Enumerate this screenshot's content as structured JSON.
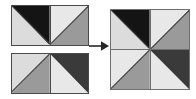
{
  "figure": {
    "background": "#ffffff",
    "outline_color": "#4a4a4a",
    "diagonal_color": "#3c3c3c"
  },
  "palette": {
    "black": "#141414",
    "dark_gray": "#3a3a3a",
    "medium_gray": "#9a9a9a",
    "light_gray": "#dcdcdc",
    "pale_gray": "#e8e8e8"
  },
  "operator": {
    "name": "right-arrow",
    "symbol": "→",
    "label": "yields"
  },
  "sources": [
    {
      "name": "top-source-rectangle",
      "label": "Top source pair",
      "squares": [
        {
          "name": "top-source-left-square",
          "diagonal": "tl-br",
          "upper_fill": "#141414",
          "lower_fill": "#dcdcdc",
          "upper_shade": "black",
          "lower_shade": "light_gray"
        },
        {
          "name": "top-source-right-square",
          "diagonal": "tr-bl",
          "upper_fill": "#e8e8e8",
          "lower_fill": "#9a9a9a",
          "upper_shade": "pale_gray",
          "lower_shade": "medium_gray"
        }
      ]
    },
    {
      "name": "bottom-source-rectangle",
      "label": "Bottom source pair",
      "squares": [
        {
          "name": "bottom-source-left-square",
          "diagonal": "tr-bl",
          "upper_fill": "#dcdcdc",
          "lower_fill": "#9a9a9a",
          "upper_shade": "light_gray",
          "lower_shade": "medium_gray"
        },
        {
          "name": "bottom-source-right-square",
          "diagonal": "tl-br",
          "upper_fill": "#3a3a3a",
          "lower_fill": "#e8e8e8",
          "upper_shade": "dark_gray",
          "lower_shade": "pale_gray"
        }
      ]
    }
  ],
  "result": {
    "name": "pinwheel-result-block",
    "label": "Resulting pinwheel block",
    "rows": 2,
    "columns": 2,
    "quadrants": [
      {
        "name": "result-top-left-quadrant",
        "position": "top-left",
        "diagonal": "tl-br",
        "upper_fill": "#141414",
        "lower_fill": "#dcdcdc",
        "upper_shade": "black",
        "lower_shade": "light_gray"
      },
      {
        "name": "result-top-right-quadrant",
        "position": "top-right",
        "diagonal": "tr-bl",
        "upper_fill": "#e8e8e8",
        "lower_fill": "#9a9a9a",
        "upper_shade": "pale_gray",
        "lower_shade": "medium_gray"
      },
      {
        "name": "result-bottom-left-quadrant",
        "position": "bottom-left",
        "diagonal": "tr-bl",
        "upper_fill": "#e8e8e8",
        "lower_fill": "#9a9a9a",
        "upper_shade": "pale_gray",
        "lower_shade": "medium_gray"
      },
      {
        "name": "result-bottom-right-quadrant",
        "position": "bottom-right",
        "diagonal": "tl-br",
        "upper_fill": "#3a3a3a",
        "lower_fill": "#e8e8e8",
        "upper_shade": "dark_gray",
        "lower_shade": "pale_gray"
      }
    ]
  }
}
